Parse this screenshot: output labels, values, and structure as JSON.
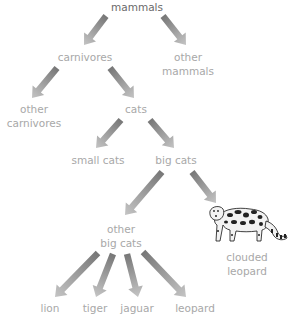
{
  "diagram": {
    "type": "taxonomy-tree",
    "nodes": [
      {
        "id": "mammals",
        "lines": [
          "mammals"
        ],
        "x": 137,
        "y": 0,
        "emphasis": true
      },
      {
        "id": "carnivores",
        "lines": [
          "carnivores"
        ],
        "x": 85,
        "y": 50
      },
      {
        "id": "other_mammals",
        "lines": [
          "other",
          "mammals"
        ],
        "x": 188,
        "y": 50
      },
      {
        "id": "other_carnivores",
        "lines": [
          "other",
          "carnivores"
        ],
        "x": 34,
        "y": 102
      },
      {
        "id": "cats",
        "lines": [
          "cats"
        ],
        "x": 136,
        "y": 102
      },
      {
        "id": "small_cats",
        "lines": [
          "small cats"
        ],
        "x": 98,
        "y": 153
      },
      {
        "id": "big_cats",
        "lines": [
          "big cats"
        ],
        "x": 176,
        "y": 153
      },
      {
        "id": "other_big_cats",
        "lines": [
          "other",
          "big cats"
        ],
        "x": 121,
        "y": 222
      },
      {
        "id": "clouded_leopard",
        "lines": [
          "clouded",
          "leopard"
        ],
        "x": 247,
        "y": 250
      },
      {
        "id": "lion",
        "lines": [
          "lion"
        ],
        "x": 50,
        "y": 301
      },
      {
        "id": "tiger",
        "lines": [
          "tiger"
        ],
        "x": 95,
        "y": 301
      },
      {
        "id": "jaguar",
        "lines": [
          "jaguar"
        ],
        "x": 137,
        "y": 301
      },
      {
        "id": "leopard",
        "lines": [
          "leopard"
        ],
        "x": 195,
        "y": 301
      }
    ],
    "edges": [
      {
        "from": "mammals",
        "to": "carnivores",
        "x1": 106,
        "y1": 16,
        "x2": 84,
        "y2": 45
      },
      {
        "from": "mammals",
        "to": "other_mammals",
        "x1": 163,
        "y1": 16,
        "x2": 186,
        "y2": 45
      },
      {
        "from": "carnivores",
        "to": "other_carnivores",
        "x1": 57,
        "y1": 68,
        "x2": 32,
        "y2": 98
      },
      {
        "from": "carnivores",
        "to": "cats",
        "x1": 110,
        "y1": 68,
        "x2": 134,
        "y2": 98
      },
      {
        "from": "cats",
        "to": "small_cats",
        "x1": 121,
        "y1": 120,
        "x2": 96,
        "y2": 148
      },
      {
        "from": "cats",
        "to": "big_cats",
        "x1": 150,
        "y1": 120,
        "x2": 174,
        "y2": 148
      },
      {
        "from": "big_cats",
        "to": "other_big_cats",
        "x1": 162,
        "y1": 172,
        "x2": 125,
        "y2": 215
      },
      {
        "from": "big_cats",
        "to": "clouded_leopard",
        "x1": 192,
        "y1": 172,
        "x2": 216,
        "y2": 203
      },
      {
        "from": "other_big_cats",
        "to": "lion",
        "x1": 98,
        "y1": 253,
        "x2": 55,
        "y2": 297
      },
      {
        "from": "other_big_cats",
        "to": "tiger",
        "x1": 113,
        "y1": 254,
        "x2": 96,
        "y2": 297
      },
      {
        "from": "other_big_cats",
        "to": "jaguar",
        "x1": 127,
        "y1": 254,
        "x2": 138,
        "y2": 297
      },
      {
        "from": "other_big_cats",
        "to": "leopard",
        "x1": 143,
        "y1": 252,
        "x2": 186,
        "y2": 297
      }
    ],
    "image": {
      "subject": "clouded-leopard-illustration"
    }
  },
  "colors": {
    "label": "#a8a8a8",
    "label_root": "#6a6a6a",
    "arrow_tail": "#777777",
    "arrow_head": "#c4c4c4",
    "background": "#ffffff"
  }
}
